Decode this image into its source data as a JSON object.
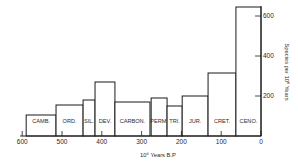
{
  "chart_data": {
    "type": "bar",
    "title": "",
    "xlabel": "10⁶ Years B.P",
    "ylabel": "Species per 10⁶ Years",
    "x_reversed": true,
    "xlim": [
      600,
      0
    ],
    "ylim": [
      0,
      650
    ],
    "grid": false,
    "legend": null,
    "x_ticks": [
      600,
      500,
      400,
      300,
      200,
      100,
      0
    ],
    "y_ticks": [
      200,
      400,
      600
    ],
    "y_axis_position": "right",
    "categories": [
      "CAMB.",
      "ORD.",
      "SIL.",
      "DEV.",
      "CARBON.",
      "PERM.",
      "TRI.",
      "JUR.",
      "CRET.",
      "CENO."
    ],
    "bars": [
      {
        "label": "CAMB.",
        "start": 590,
        "end": 515,
        "value": 105
      },
      {
        "label": "ORD.",
        "start": 515,
        "end": 447,
        "value": 155
      },
      {
        "label": "SIL.",
        "start": 447,
        "end": 417,
        "value": 180
      },
      {
        "label": "DEV.",
        "start": 417,
        "end": 367,
        "value": 270
      },
      {
        "label": "CARBON.",
        "start": 367,
        "end": 279,
        "value": 170
      },
      {
        "label": "PERM.",
        "start": 276,
        "end": 236,
        "value": 190
      },
      {
        "label": "TRI.",
        "start": 236,
        "end": 198,
        "value": 150
      },
      {
        "label": "JUR.",
        "start": 198,
        "end": 133,
        "value": 200
      },
      {
        "label": "CRET.",
        "start": 133,
        "end": 63,
        "value": 315
      },
      {
        "label": "CENO.",
        "start": 63,
        "end": 0,
        "value": 645
      }
    ],
    "values": [
      105,
      155,
      180,
      270,
      170,
      190,
      150,
      200,
      315,
      645
    ]
  }
}
